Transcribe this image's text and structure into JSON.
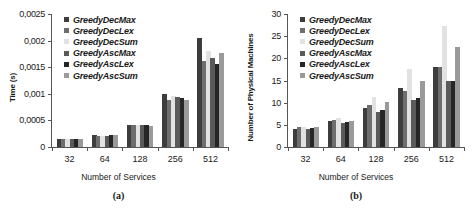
{
  "figure": {
    "series": [
      {
        "name": "GreedyDecMax",
        "color": "#3d3d3d"
      },
      {
        "name": "GreedyDecLex",
        "color": "#6e6e6e"
      },
      {
        "name": "GreedyDecSum",
        "color": "#e2e2e2"
      },
      {
        "name": "GreedyAscMax",
        "color": "#5a5a5a"
      },
      {
        "name": "GreedyAscLex",
        "color": "#262626"
      },
      {
        "name": "GreedyAscSum",
        "color": "#9a9a9a"
      }
    ]
  },
  "chart_data": [
    {
      "type": "bar",
      "panel": "a",
      "caption": "(a)",
      "title": "",
      "xlabel": "Number of Services",
      "ylabel": "Time (s)",
      "categories": [
        "32",
        "64",
        "128",
        "256",
        "512"
      ],
      "ylim": [
        0,
        0.0025
      ],
      "yticks": [
        0,
        0.0005,
        0.001,
        0.0015,
        0.002,
        0.0025
      ],
      "ytick_labels": [
        "0",
        "0,0005",
        "0,001",
        "0,0015",
        "0,002",
        "0,0025"
      ],
      "grid": false,
      "legend_position": "top-left inside",
      "series": [
        {
          "name": "GreedyDecMax",
          "values": [
            0.00015,
            0.00023,
            0.00042,
            0.00099,
            0.00205
          ]
        },
        {
          "name": "GreedyDecLex",
          "values": [
            0.00015,
            0.0002,
            0.00041,
            0.00088,
            0.00161
          ]
        },
        {
          "name": "GreedyDecSum",
          "values": [
            0.00016,
            0.0002,
            0.00041,
            0.00095,
            0.0018
          ]
        },
        {
          "name": "GreedyAscMax",
          "values": [
            0.00015,
            0.00021,
            0.00041,
            0.00094,
            0.00168
          ]
        },
        {
          "name": "GreedyAscLex",
          "values": [
            0.00015,
            0.00022,
            0.00041,
            0.00092,
            0.00156
          ]
        },
        {
          "name": "GreedyAscSum",
          "values": [
            0.00015,
            0.00022,
            0.0004,
            0.00089,
            0.00177
          ]
        }
      ]
    },
    {
      "type": "bar",
      "panel": "b",
      "caption": "(b)",
      "title": "",
      "xlabel": "Number of Services",
      "ylabel": "Number of Physical Machines",
      "categories": [
        "32",
        "64",
        "128",
        "256",
        "512"
      ],
      "ylim": [
        0,
        30
      ],
      "yticks": [
        0,
        5,
        10,
        15,
        20,
        25,
        30
      ],
      "ytick_labels": [
        "0",
        "5",
        "10",
        "15",
        "20",
        "25",
        "30"
      ],
      "grid": false,
      "legend_position": "top-left inside",
      "series": [
        {
          "name": "GreedyDecMax",
          "values": [
            4.1,
            5.9,
            8.8,
            13.2,
            18.0
          ]
        },
        {
          "name": "GreedyDecLex",
          "values": [
            4.5,
            6.2,
            9.5,
            12.7,
            18.0
          ]
        },
        {
          "name": "GreedyDecSum",
          "values": [
            4.5,
            6.5,
            11.2,
            17.5,
            27.4
          ]
        },
        {
          "name": "GreedyAscMax",
          "values": [
            4.0,
            5.4,
            7.8,
            10.6,
            14.9
          ]
        },
        {
          "name": "GreedyAscLex",
          "values": [
            4.4,
            5.7,
            8.3,
            11.0,
            14.9
          ]
        },
        {
          "name": "GreedyAscSum",
          "values": [
            4.5,
            5.9,
            10.2,
            15.0,
            22.5
          ]
        }
      ]
    }
  ]
}
